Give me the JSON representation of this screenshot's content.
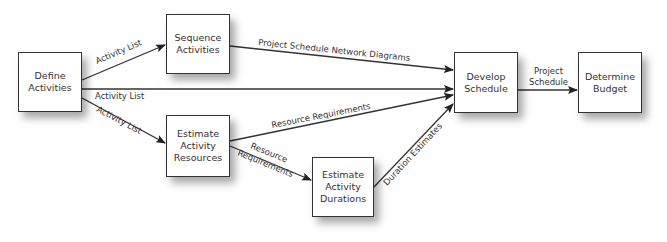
{
  "diagram": {
    "nodes": [
      {
        "id": "define",
        "label": "Define\nActivities"
      },
      {
        "id": "sequence",
        "label": "Sequence\nActivities"
      },
      {
        "id": "resources",
        "label": "Estimate\nActivity\nResources"
      },
      {
        "id": "durations",
        "label": "Estimate\nActivity\nDurations"
      },
      {
        "id": "develop",
        "label": "Develop\nSchedule"
      },
      {
        "id": "budget",
        "label": "Determine\nBudget"
      }
    ],
    "edges": [
      {
        "from": "define",
        "to": "sequence",
        "label": "Activity List"
      },
      {
        "from": "define",
        "to": "develop",
        "label": "Activity List"
      },
      {
        "from": "define",
        "to": "resources",
        "label": "Activity List"
      },
      {
        "from": "sequence",
        "to": "develop",
        "label": "Project Schedule Network Diagrams"
      },
      {
        "from": "resources",
        "to": "develop",
        "label": "Resource Requirements"
      },
      {
        "from": "resources",
        "to": "durations",
        "label_line1": "Resource",
        "label_line2": "Requirements"
      },
      {
        "from": "durations",
        "to": "develop",
        "label": "Duration Estimates"
      },
      {
        "from": "develop",
        "to": "budget",
        "label_line1": "Project",
        "label_line2": "Schedule"
      }
    ]
  }
}
